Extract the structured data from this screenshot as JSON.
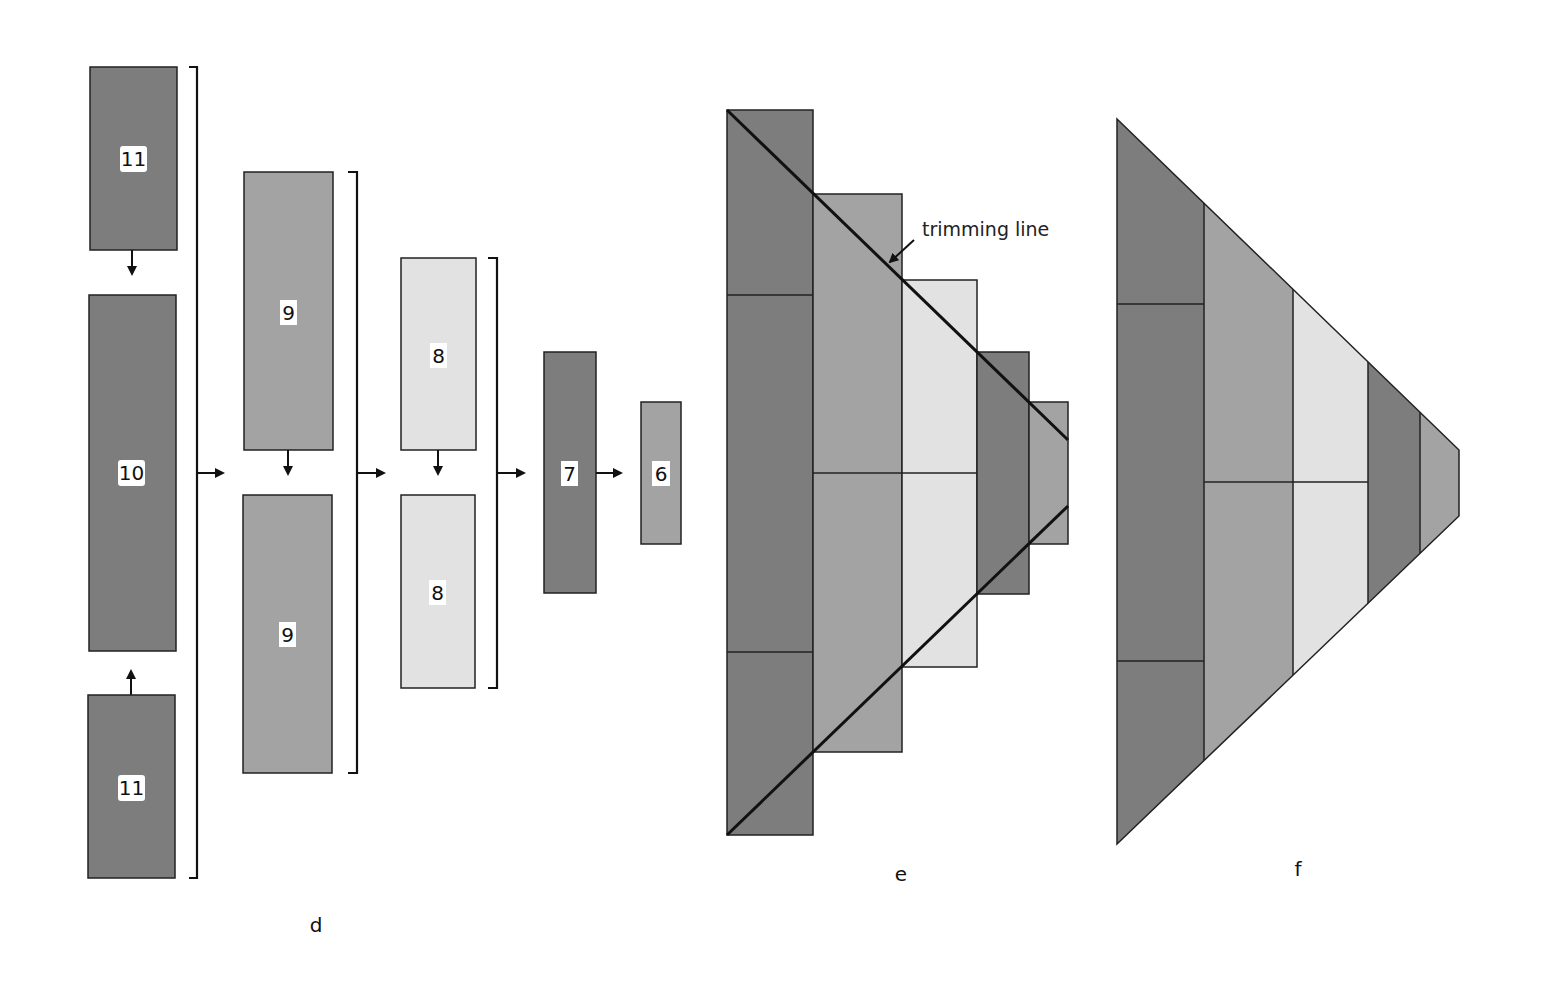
{
  "colors": {
    "dark": "#7d7d7d",
    "medium": "#a3a3a3",
    "light": "#e2e2e2",
    "stroke": "#222222",
    "label_bg": "#ffffff"
  },
  "panel_d": {
    "label": "d",
    "boxes": [
      {
        "id": "box-11-top",
        "label": "11",
        "shade": "dark"
      },
      {
        "id": "box-10",
        "label": "10",
        "shade": "dark"
      },
      {
        "id": "box-11-bottom",
        "label": "11",
        "shade": "dark"
      },
      {
        "id": "box-9-top",
        "label": "9",
        "shade": "medium"
      },
      {
        "id": "box-9-bottom",
        "label": "9",
        "shade": "medium"
      },
      {
        "id": "box-8-top",
        "label": "8",
        "shade": "light"
      },
      {
        "id": "box-8-bottom",
        "label": "8",
        "shade": "light"
      },
      {
        "id": "box-7",
        "label": "7",
        "shade": "dark"
      },
      {
        "id": "box-6",
        "label": "6",
        "shade": "medium"
      }
    ]
  },
  "panel_e": {
    "label": "e",
    "annotation": "trimming line"
  },
  "panel_f": {
    "label": "f"
  }
}
